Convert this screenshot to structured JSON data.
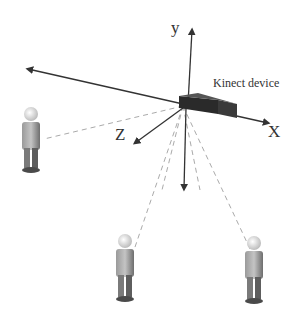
{
  "diagram": {
    "device": {
      "label": "Kinect device"
    },
    "axes": [
      {
        "name": "x",
        "label": "X"
      },
      {
        "name": "y",
        "label": "y"
      },
      {
        "name": "z",
        "label": "Z"
      }
    ],
    "people": [
      {
        "id": "person-left"
      },
      {
        "id": "person-bottom-left"
      },
      {
        "id": "person-bottom-right"
      }
    ],
    "colors": {
      "axis": "#333333",
      "dashed": "#aaaaaa",
      "device": "#2a2a2a",
      "person": "#8a8a8a"
    }
  }
}
